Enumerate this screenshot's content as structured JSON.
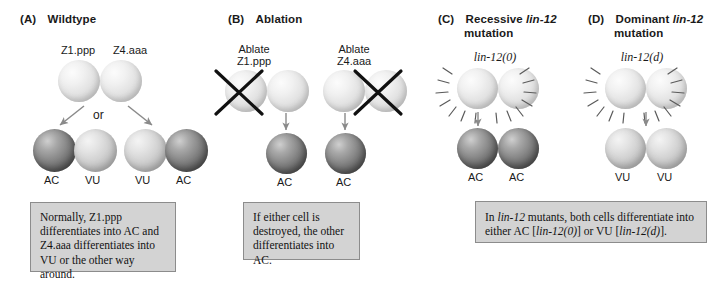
{
  "figure": {
    "panels": [
      {
        "id": "A",
        "letter": "(A)",
        "title": "Wildtype",
        "title_italic_part": "",
        "precursor_labels": [
          "Z1.ppp",
          "Z4.aaa"
        ],
        "connector_text": "or",
        "outcome_labels": [
          "AC",
          "VU",
          "VU",
          "AC"
        ],
        "caption": "Normally, Z1.ppp differentiates into AC and Z4.aaa differentiates into VU or the other way around."
      },
      {
        "id": "B",
        "letter": "(B)",
        "title": "Ablation",
        "precursor_labels": [
          "Ablate Z1.ppp",
          "Ablate Z4.aaa"
        ],
        "ablate_line1": "Ablate",
        "ablate_left_line2": "Z1.ppp",
        "ablate_right_line2": "Z4.aaa",
        "outcome_labels": [
          "AC",
          "AC"
        ],
        "caption": "If either cell is destroyed, the other differentiates into AC."
      },
      {
        "id": "C",
        "letter": "(C)",
        "title_pre": "Recessive ",
        "title_gene": "lin-12",
        "title_post": "mutation",
        "genotype": "lin-12(0)",
        "outcome_labels": [
          "AC",
          "AC"
        ]
      },
      {
        "id": "D",
        "letter": "(D)",
        "title_pre": "Dominant ",
        "title_gene": "lin-12",
        "title_post": "mutation",
        "genotype": "lin-12(d)",
        "outcome_labels": [
          "VU",
          "VU"
        ]
      }
    ],
    "shared_caption": {
      "part1": "In ",
      "gene1": "lin-12",
      "part2": " mutants, both cells differentiate into either AC [",
      "gene2": "lin-12(0)",
      "part3": "] or VU [",
      "gene3": "lin-12(d)",
      "part4": "]."
    },
    "colors": {
      "ac_cell": "#6b6b6b",
      "vu_cell": "#c3c3c3",
      "precursor_cell": "#e8e8e8",
      "caption_box_bg": "#d3d3d3",
      "caption_box_border": "#8c8c8c",
      "ablation_mark": "#111111",
      "background": "#ffffff"
    }
  }
}
